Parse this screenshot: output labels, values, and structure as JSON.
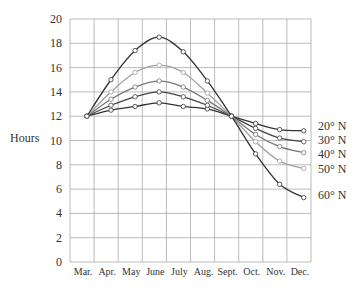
{
  "chart_data": {
    "type": "line",
    "title": "",
    "xlabel": "",
    "ylabel": "Hours",
    "ylim": [
      0,
      20
    ],
    "yticks": [
      0,
      2,
      4,
      6,
      8,
      10,
      12,
      14,
      16,
      18,
      20
    ],
    "grid": true,
    "legend_position": "right, inline labels at line ends",
    "categories": [
      "Mar.",
      "Apr.",
      "May",
      "June",
      "July",
      "Aug.",
      "Sept.",
      "Oct.",
      "Nov.",
      "Dec."
    ],
    "series": [
      {
        "name": "20° N",
        "color": "#333333",
        "values": [
          12.0,
          12.5,
          12.8,
          13.1,
          12.8,
          12.6,
          12.0,
          11.4,
          10.9,
          10.8
        ]
      },
      {
        "name": "30° N",
        "color": "#444444",
        "values": [
          12.0,
          12.9,
          13.6,
          14.0,
          13.6,
          12.9,
          12.0,
          11.0,
          10.2,
          9.9
        ]
      },
      {
        "name": "40° N",
        "color": "#777777",
        "values": [
          12.0,
          13.4,
          14.4,
          14.9,
          14.4,
          13.3,
          12.0,
          10.5,
          9.5,
          9.0
        ]
      },
      {
        "name": "50° N",
        "color": "#a0a0a0",
        "values": [
          12.0,
          14.0,
          15.6,
          16.2,
          15.6,
          13.9,
          12.0,
          9.9,
          8.3,
          7.7
        ]
      },
      {
        "name": "60° N",
        "color": "#333333",
        "values": [
          12.0,
          15.0,
          17.4,
          18.5,
          17.3,
          14.9,
          12.0,
          8.9,
          6.4,
          5.3
        ]
      }
    ]
  }
}
